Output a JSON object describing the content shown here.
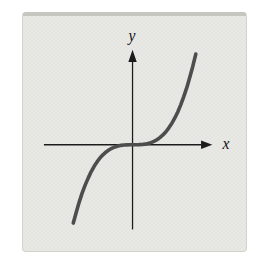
{
  "figure": {
    "bg_color": "#ffffff",
    "panel_bg": "#e8e8e4",
    "panel_top_edge": "#c6c6c1",
    "panel_border": "#d2d2cd",
    "axis_color": "#1c1c1c",
    "curve_color": "#4d4d4d",
    "label_color": "#111111"
  },
  "chart_data": {
    "type": "line",
    "title": "",
    "xlabel": "x",
    "ylabel": "y",
    "curve": "y = x^3",
    "grid": false,
    "legend": null,
    "tick_labels": [],
    "xlim": [
      -3.0,
      2.7
    ],
    "ylim": [
      -8.7,
      9.7
    ],
    "x": [
      -2.0,
      -1.9,
      -1.8,
      -1.7,
      -1.6,
      -1.5,
      -1.4,
      -1.3,
      -1.2,
      -1.1,
      -1.0,
      -0.9,
      -0.8,
      -0.7,
      -0.6,
      -0.5,
      -0.4,
      -0.3,
      -0.2,
      -0.1,
      0.0,
      0.1,
      0.2,
      0.3,
      0.4,
      0.5,
      0.6,
      0.7,
      0.8,
      0.9,
      1.0,
      1.1,
      1.2,
      1.3,
      1.4,
      1.5,
      1.6,
      1.7,
      1.8,
      1.9,
      2.0,
      2.1
    ],
    "y": [
      -8.0,
      -6.859,
      -5.832,
      -4.913,
      -4.096,
      -3.375,
      -2.744,
      -2.197,
      -1.728,
      -1.331,
      -1.0,
      -0.729,
      -0.512,
      -0.343,
      -0.216,
      -0.125,
      -0.064,
      -0.027,
      -0.008,
      -0.001,
      0.0,
      0.001,
      0.008,
      0.027,
      0.064,
      0.125,
      0.216,
      0.343,
      0.512,
      0.729,
      1.0,
      1.331,
      1.728,
      2.197,
      2.744,
      3.375,
      4.096,
      4.913,
      5.832,
      6.859,
      8.0,
      9.261
    ]
  }
}
